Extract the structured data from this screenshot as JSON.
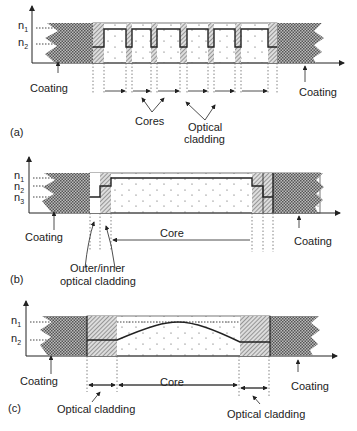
{
  "panels": [
    {
      "id": "a",
      "tag": "(a)",
      "axis_labels": {
        "n1": "n",
        "n1_sub": "1",
        "n2": "n",
        "n2_sub": "2"
      },
      "labels": {
        "coating_left": "Coating",
        "coating_right": "Coating",
        "cores": "Cores",
        "optical_cladding_line1": "Optical",
        "optical_cladding_line2": "cladding"
      },
      "description": "Multi-core fiber step-index profile with six cores separated by optical cladding"
    },
    {
      "id": "b",
      "tag": "(b)",
      "axis_labels": {
        "n1": "n",
        "n1_sub": "1",
        "n2": "n",
        "n2_sub": "2",
        "n3": "n",
        "n3_sub": "3"
      },
      "labels": {
        "coating_left": "Coating",
        "coating_right": "Coating",
        "core": "Core",
        "cladding_line1": "Outer/inner",
        "cladding_line2": "optical cladding"
      },
      "description": "Double-clad fiber with outer/inner optical cladding and large core"
    },
    {
      "id": "c",
      "tag": "(c)",
      "axis_labels": {
        "n1": "n",
        "n1_sub": "1",
        "n2": "n",
        "n2_sub": "2"
      },
      "labels": {
        "coating_left": "Coating",
        "coating_right": "Coating",
        "core": "Core",
        "cladding_left": "Optical cladding",
        "cladding_right": "Optical cladding"
      },
      "description": "Graded-index fiber with parabolic core refractive index profile"
    }
  ],
  "colors": {
    "line": "#222222",
    "coating_fill": "#9a9a9a",
    "hatch": "#555555",
    "dot": "#444444"
  }
}
